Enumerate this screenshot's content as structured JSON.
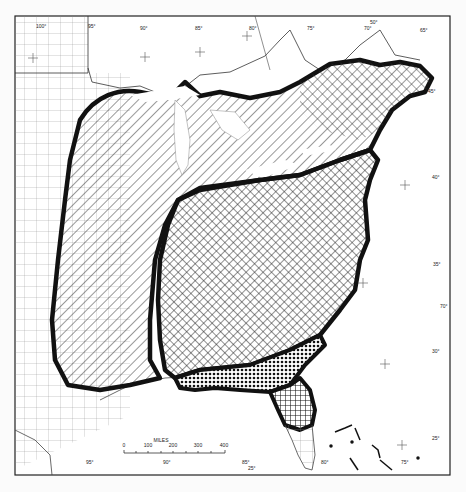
{
  "map": {
    "longitude_labels_top": [
      "100°",
      "95°",
      "90°",
      "85°",
      "80°",
      "75°",
      "50°",
      "70°",
      "65°"
    ],
    "longitude_labels_bottom": [
      "95°",
      "90°",
      "85°",
      "80°",
      "75°"
    ],
    "latitude_labels_right": [
      "45°",
      "40°",
      "35°",
      "70°",
      "30°",
      "25°"
    ],
    "latitude_label_small": [
      "25°"
    ],
    "scale": {
      "title": "MILES",
      "ticks": [
        "0",
        "100",
        "200",
        "300",
        "400"
      ]
    }
  }
}
